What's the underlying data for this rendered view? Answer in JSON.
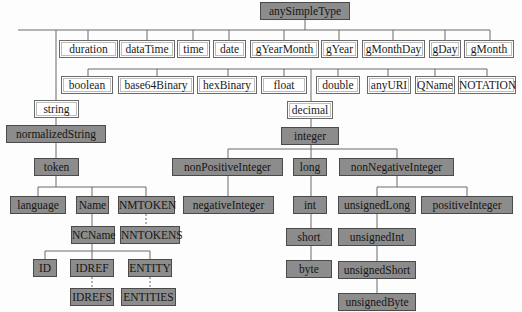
{
  "diagram": {
    "colors": {
      "primitive_fill": "#ffffff",
      "derived_fill": "#8c8c8c",
      "line": "#6a6a6a"
    },
    "root": {
      "label": "anySimpleType",
      "style": "shaded"
    },
    "primitives_row1": [
      {
        "label": "duration"
      },
      {
        "label": "dataTime"
      },
      {
        "label": "time"
      },
      {
        "label": "date"
      },
      {
        "label": "gYearMonth"
      },
      {
        "label": "gYear"
      },
      {
        "label": "gMonthDay"
      },
      {
        "label": "gDay"
      },
      {
        "label": "gMonth"
      }
    ],
    "primitives_row2": [
      {
        "label": "boolean"
      },
      {
        "label": "base64Binary"
      },
      {
        "label": "hexBinary"
      },
      {
        "label": "float"
      },
      {
        "label": "double"
      },
      {
        "label": "anyURI"
      },
      {
        "label": "QName"
      },
      {
        "label": "NOTATION"
      }
    ],
    "string_branch": {
      "string": "string",
      "normalizedString": "normalizedString",
      "token": "token",
      "language": "language",
      "Name": "Name",
      "NMTOKEN": "NMTOKEN",
      "NCName": "NCName",
      "NNTOKENS": "NNTOKENS",
      "ID": "ID",
      "IDREF": "IDREF",
      "ENTITY": "ENTITY",
      "IDREFS": "IDREFS",
      "ENTITIES": "ENTITIES"
    },
    "decimal_branch": {
      "decimal": "decimal",
      "integer": "integer",
      "nonPositiveInteger": "nonPositiveInteger",
      "negativeInteger": "negativeInteger",
      "long": "long",
      "int": "int",
      "short": "short",
      "byte": "byte",
      "nonNegativeInteger": "nonNegativeInteger",
      "unsignedLong": "unsignedLong",
      "unsignedInt": "unsignedInt",
      "unsignedShort": "unsignedShort",
      "unsignedByte": "unsignedByte",
      "positiveInteger": "positiveInteger"
    }
  }
}
